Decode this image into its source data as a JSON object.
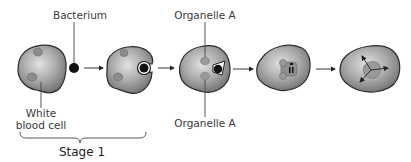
{
  "diagram": {
    "labels": {
      "bacterium": "Bacterium",
      "white_blood_cell_line1": "White",
      "white_blood_cell_line2": "blood cell",
      "organelle_top": "Organelle A",
      "organelle_bottom": "Organelle A",
      "stage": "Stage 1"
    },
    "steps": [
      {
        "id": 1,
        "description": "White blood cell with bacterium nearby"
      },
      {
        "id": 2,
        "description": "Cell membrane surrounds bacterium"
      },
      {
        "id": 3,
        "description": "Bacterium enclosed in vesicle; Organelle A approaches"
      },
      {
        "id": 4,
        "description": "Organelles A fuse with vesicle; bacterium digested"
      },
      {
        "id": 5,
        "description": "Digested products dispersed"
      }
    ],
    "colors": {
      "cell_fill_light": "#d6d6d6",
      "cell_fill_dark": "#7a7a7a",
      "outline": "#2a2a2a",
      "organelle": "#9a9a9a",
      "bacterium": "#111111"
    }
  }
}
